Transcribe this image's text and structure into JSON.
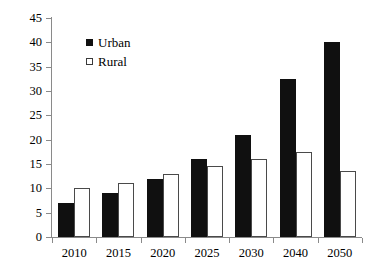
{
  "chart_data": {
    "type": "bar",
    "title": "",
    "subtitle": "",
    "xlabel": "",
    "ylabel": "",
    "categories": [
      "2010",
      "2015",
      "2020",
      "2025",
      "2030",
      "2040",
      "2050"
    ],
    "series": [
      {
        "name": "Urban",
        "values": [
          7,
          9,
          12,
          16,
          21,
          32.5,
          40
        ],
        "marker": "filled-square",
        "color": "#101010"
      },
      {
        "name": "Rural",
        "values": [
          10,
          11,
          13,
          14.5,
          16,
          17.5,
          13.5
        ],
        "marker": "hollow-square",
        "color": "#ffffff"
      }
    ],
    "ylim": [
      0,
      45
    ],
    "ytick_step": 5,
    "yticks": [
      "0",
      "5",
      "10",
      "15",
      "20",
      "25",
      "30",
      "35",
      "40",
      "45"
    ],
    "grid": false,
    "legend_position": "upper-left-inside",
    "annotations": []
  },
  "legend": {
    "entries": [
      {
        "label": "Urban",
        "swatch": "filled-square"
      },
      {
        "label": "Rural",
        "swatch": "hollow-square"
      }
    ]
  }
}
